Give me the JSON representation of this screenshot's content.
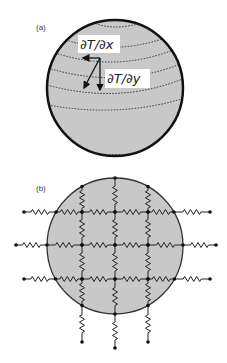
{
  "panel_a": {
    "label": "(a)",
    "circle": {
      "cx": 115,
      "cy": 88,
      "r": 68,
      "fill": "#c8c8c8",
      "stroke": "#111111"
    },
    "annotations": {
      "dTdx": "∂T/∂x",
      "dTdy": "∂T/∂y"
    }
  },
  "panel_b": {
    "label": "(b)",
    "circle": {
      "cx": 115,
      "cy": 246,
      "r": 68,
      "fill": "#c8c8c8",
      "stroke": "#333333"
    },
    "grid": {
      "columns_x": [
        82,
        115,
        148
      ],
      "rows_y": [
        212,
        245,
        279
      ]
    }
  },
  "colors": {
    "background": "#ffffff",
    "disk_fill": "#c8c8c8",
    "line": "#222222"
  }
}
